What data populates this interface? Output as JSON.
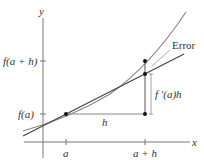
{
  "diagram": {
    "type": "linear-approximation",
    "axes": {
      "x_label": "x",
      "y_label": "y"
    },
    "x_ticks": [
      {
        "label": "a",
        "x": 66
      },
      {
        "label": "a + h",
        "x": 145
      }
    ],
    "y_ticks": [
      {
        "label": "f(a)",
        "y": 114
      },
      {
        "label": "f(a + h)",
        "y": 61
      }
    ],
    "segment_labels": {
      "h": "h",
      "rise": "f ′(a)h",
      "error": "Error"
    },
    "points": [
      {
        "name": "tangent-point",
        "x": 66,
        "y": 114
      },
      {
        "name": "corner-point",
        "x": 145,
        "y": 114
      },
      {
        "name": "tangent-line-point",
        "x": 145,
        "y": 74
      },
      {
        "name": "curve-point",
        "x": 145,
        "y": 61
      }
    ],
    "colors": {
      "axis": "#666666",
      "curve": "#8a8a8a",
      "tangent": "#444444",
      "points": "#111111",
      "text": "#333333"
    }
  }
}
